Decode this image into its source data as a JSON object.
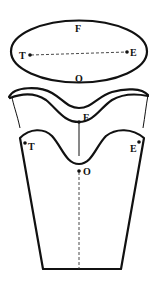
{
  "diagram": {
    "colors": {
      "stroke": "#111111",
      "background": "#ffffff"
    },
    "ellipse": {
      "labels": {
        "front": "F",
        "back": "O",
        "left": "T",
        "right": "E"
      },
      "line_style": "dashed"
    },
    "band": {
      "labels": {
        "front": "F"
      }
    },
    "body": {
      "labels": {
        "left": "T",
        "right": "E",
        "center": "O"
      },
      "line_style": "dashed"
    }
  }
}
